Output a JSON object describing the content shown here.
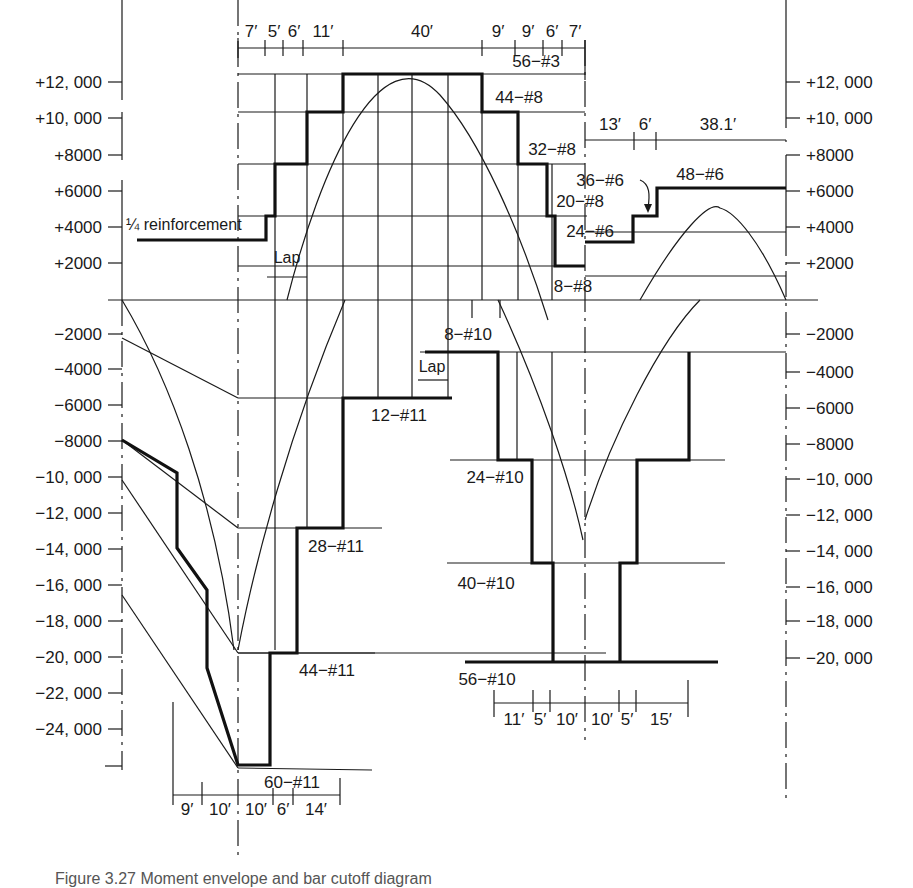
{
  "figure": {
    "title": "Moment envelope and bar cutoff diagram",
    "caption_partial": "Figure 3.27  Moment envelope and bar cutoff diagram"
  },
  "left_axis": {
    "positive_ticks": [
      "+12, 000",
      "+10, 000",
      "+8000",
      "+6000",
      "+4000",
      "+2000"
    ],
    "negative_ticks": [
      "−2000",
      "−4000",
      "−6000",
      "−8000",
      "−10, 000",
      "−12, 000",
      "−14, 000",
      "−16, 000",
      "−18, 000",
      "−20, 000",
      "−22, 000",
      "−24, 000"
    ]
  },
  "right_axis": {
    "positive_ticks": [
      "+12, 000",
      "+10, 000",
      "+8000",
      "+6000",
      "+4000",
      "+2000"
    ],
    "negative_ticks": [
      "−2000",
      "−4000",
      "−6000",
      "−8000",
      "−10, 000",
      "−12, 000",
      "−14, 000",
      "−16, 000",
      "−18, 000",
      "−20, 000"
    ]
  },
  "top_dimensions": [
    "7′",
    "5′",
    "6′",
    "11′",
    "40′",
    "9′",
    "9′",
    "6′",
    "7′"
  ],
  "right_span_dimensions": [
    "13′",
    "6′",
    "38.1′"
  ],
  "bottom_left_dimensions": [
    "9′",
    "10′",
    "10′",
    "6′",
    "14′"
  ],
  "bottom_mid_dimensions": [
    "11′",
    "5′",
    "10′",
    "10′",
    "5′",
    "15′"
  ],
  "bar_labels": {
    "pos_56_3": "56−#3",
    "pos_44_8": "44−#8",
    "pos_32_8": "32−#8",
    "pos_20_8": "20−#8",
    "pos_8_8": "8−#8",
    "pos_36_6": "36−#6",
    "pos_24_6": "24−#6",
    "pos_48_6": "48−#6",
    "neg_12_11": "12−#11",
    "neg_28_11": "28−#11",
    "neg_44_11": "44−#11",
    "neg_60_11": "60−#11",
    "neg_8_10": "8−#10",
    "neg_24_10": "24−#10",
    "neg_40_10": "40−#10",
    "neg_56_10": "56−#10"
  },
  "annotations": {
    "quarter_reinforcement": "¼ reinforcement",
    "lap_top": "Lap",
    "lap_mid": "Lap"
  },
  "colors": {
    "ink": "#1a1a1a",
    "paper": "#ffffff"
  }
}
